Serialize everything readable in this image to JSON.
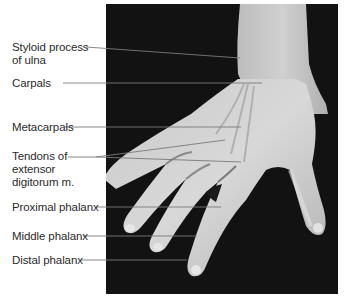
{
  "figure": {
    "colors": {
      "background": "#ffffff",
      "photo_background": "#121212",
      "skin_light": "#d4d4d4",
      "skin_mid": "#a8a8a8",
      "leader_line": "#7a7a7a",
      "label_text": "#2b2b2b"
    },
    "labels": [
      {
        "id": "styloid",
        "text": "Styloid process\nof ulna",
        "x": 12,
        "y": 41,
        "line": [
          [
            86,
            47
          ],
          [
            240,
            58
          ]
        ]
      },
      {
        "id": "carpals",
        "text": "Carpals",
        "x": 12,
        "y": 77,
        "line": [
          [
            63,
            83
          ],
          [
            262,
            83
          ]
        ]
      },
      {
        "id": "metacarpals",
        "text": "Metacarpals",
        "x": 12,
        "y": 121,
        "line": [
          [
            65,
            127
          ],
          [
            241,
            127
          ]
        ]
      },
      {
        "id": "tendons",
        "text": "Tendons of\nextensor\ndigitorum m.",
        "x": 12,
        "y": 150,
        "lines": [
          [
            [
              68,
              157
            ],
            [
              96,
              157
            ],
            [
              225,
              140
            ]
          ],
          [
            [
              96,
              157
            ],
            [
              241,
              162
            ]
          ]
        ]
      },
      {
        "id": "proximal",
        "text": "Proximal phalanx",
        "x": 12,
        "y": 201,
        "line": [
          [
            96,
            207
          ],
          [
            221,
            207
          ]
        ]
      },
      {
        "id": "middle",
        "text": "Middle phalanx",
        "x": 12,
        "y": 230,
        "line": [
          [
            83,
            236
          ],
          [
            197,
            236
          ]
        ]
      },
      {
        "id": "distal",
        "text": "Distal phalanx",
        "x": 12,
        "y": 254,
        "line": [
          [
            81,
            260
          ],
          [
            187,
            260
          ]
        ]
      }
    ]
  }
}
